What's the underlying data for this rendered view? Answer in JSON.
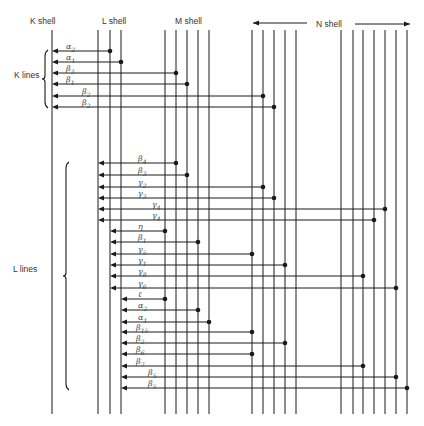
{
  "shells": {
    "K": {
      "label": "K shell",
      "label_x": 43,
      "x": [
        52
      ]
    },
    "L": {
      "label": "L shell",
      "label_x": 103,
      "x": [
        98,
        110,
        121
      ]
    },
    "M": {
      "label": "M shell",
      "label_x": 175,
      "x": [
        165,
        176,
        187,
        198,
        209
      ]
    },
    "N": {
      "label": "N shell",
      "label_x": 322,
      "x": [
        252,
        263,
        274,
        285,
        296,
        341,
        353,
        363,
        374,
        385,
        396,
        407
      ],
      "arrow_left": [
        253,
        307
      ],
      "arrow_right": [
        355,
        410
      ]
    }
  },
  "line_top": 30,
  "line_bottom": 414,
  "groups": [
    {
      "label": "K lines",
      "brace_top": 50,
      "brace_bottom": 108,
      "label_x": 14,
      "label_y": 75
    },
    {
      "label": "L lines",
      "brace_top": 162,
      "brace_bottom": 390,
      "label_x": 14,
      "label_y": 270
    }
  ],
  "transitions": [
    {
      "group": "K",
      "sym": "α",
      "sub": "2",
      "y": 51,
      "to": 52,
      "from": 110,
      "lx": 66
    },
    {
      "group": "K",
      "sym": "α",
      "sub": "1",
      "y": 62,
      "to": 52,
      "from": 121,
      "lx": 66
    },
    {
      "group": "K",
      "sym": "β",
      "sub": "3",
      "y": 73,
      "to": 52,
      "from": 176,
      "lx": 66
    },
    {
      "group": "K",
      "sym": "β",
      "sub": "1",
      "y": 84,
      "to": 52,
      "from": 187,
      "lx": 66
    },
    {
      "group": "K",
      "sym": "β",
      "sub": "2",
      "y": 96,
      "to": 52,
      "from": 263,
      "lx": 82
    },
    {
      "group": "K",
      "sym": "β",
      "sub": "2",
      "y": 107,
      "to": 52,
      "from": 274,
      "lx": 82
    },
    {
      "group": "L",
      "sym": "β",
      "sub": "4",
      "y": 163,
      "to": 98,
      "from": 176,
      "lx": 138
    },
    {
      "group": "L",
      "sym": "β",
      "sub": "3",
      "y": 175,
      "to": 98,
      "from": 187,
      "lx": 138
    },
    {
      "group": "L",
      "sym": "γ",
      "sub": "2",
      "y": 187,
      "to": 98,
      "from": 263,
      "lx": 138
    },
    {
      "group": "L",
      "sym": "γ",
      "sub": "3",
      "y": 198,
      "to": 98,
      "from": 274,
      "lx": 138
    },
    {
      "group": "L",
      "sym": "γ",
      "sub": "4",
      "y": 209,
      "to": 98,
      "from": 385,
      "lx": 152
    },
    {
      "group": "L",
      "sym": "γ",
      "sub": "4",
      "y": 220,
      "to": 98,
      "from": 374,
      "lx": 152
    },
    {
      "group": "L",
      "sym": "η",
      "sub": "",
      "y": 231,
      "to": 110,
      "from": 165,
      "lx": 138
    },
    {
      "group": "L",
      "sym": "β",
      "sub": "1",
      "y": 242,
      "to": 110,
      "from": 198,
      "lx": 138
    },
    {
      "group": "L",
      "sym": "γ",
      "sub": "5",
      "y": 254,
      "to": 110,
      "from": 252,
      "lx": 138
    },
    {
      "group": "L",
      "sym": "γ",
      "sub": "1",
      "y": 265,
      "to": 110,
      "from": 285,
      "lx": 138
    },
    {
      "group": "L",
      "sym": "γ",
      "sub": "8",
      "y": 276,
      "to": 110,
      "from": 363,
      "lx": 138
    },
    {
      "group": "L",
      "sym": "γ",
      "sub": "6",
      "y": 288,
      "to": 110,
      "from": 396,
      "lx": 138
    },
    {
      "group": "L",
      "sym": "ℓ",
      "sub": "",
      "y": 299,
      "to": 121,
      "from": 165,
      "lx": 138
    },
    {
      "group": "L",
      "sym": "α",
      "sub": "2",
      "y": 310,
      "to": 121,
      "from": 198,
      "lx": 138
    },
    {
      "group": "L",
      "sym": "α",
      "sub": "1",
      "y": 322,
      "to": 121,
      "from": 209,
      "lx": 138
    },
    {
      "group": "L",
      "sym": "β",
      "sub": "15",
      "y": 332,
      "to": 121,
      "from": 252,
      "lx": 136
    },
    {
      "group": "L",
      "sym": "β",
      "sub": "2",
      "y": 343,
      "to": 121,
      "from": 285,
      "lx": 136
    },
    {
      "group": "L",
      "sym": "β",
      "sub": "6",
      "y": 354,
      "to": 121,
      "from": 252,
      "lx": 136
    },
    {
      "group": "L",
      "sym": "β",
      "sub": "7",
      "y": 366,
      "to": 121,
      "from": 363,
      "lx": 136
    },
    {
      "group": "L",
      "sym": "β",
      "sub": "5",
      "y": 377,
      "to": 121,
      "from": 396,
      "lx": 148
    },
    {
      "group": "L",
      "sym": "β",
      "sub": "5",
      "y": 388,
      "to": 121,
      "from": 407,
      "lx": 148
    }
  ],
  "colors": {
    "line": "#1a1a1a",
    "text": "#333333",
    "background": "#ffffff"
  }
}
